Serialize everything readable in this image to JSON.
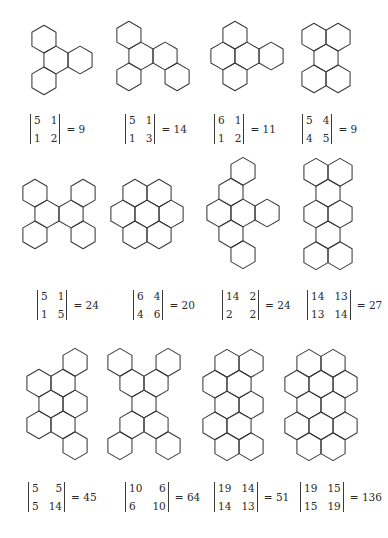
{
  "figure": {
    "stroke_color": "#3a3a3a",
    "background": "#ffffff",
    "hex_side_px": 13.9,
    "items": [
      {
        "id": "s1",
        "center": [
          62,
          60
        ],
        "hexes": [
          [
            0,
            0
          ],
          [
            0,
            1
          ],
          [
            1,
            1
          ],
          [
            -1,
            2
          ]
        ],
        "matrix": [
          [
            "5",
            "1"
          ],
          [
            "1",
            "2"
          ]
        ],
        "value": "9",
        "det_pos": [
          30,
          114
        ]
      },
      {
        "id": "s2",
        "center": [
          153,
          56
        ],
        "hexes": [
          [
            0,
            0
          ],
          [
            0,
            1
          ],
          [
            1,
            1
          ],
          [
            -1,
            2
          ],
          [
            1,
            2
          ]
        ],
        "matrix": [
          [
            "5",
            "1"
          ],
          [
            "1",
            "3"
          ]
        ],
        "value": "14",
        "det_pos": [
          125,
          114
        ]
      },
      {
        "id": "s3",
        "center": [
          247,
          56
        ],
        "hexes": [
          [
            1,
            0
          ],
          [
            0,
            1
          ],
          [
            1,
            1
          ],
          [
            2,
            1
          ],
          [
            0,
            2
          ]
        ],
        "matrix": [
          [
            "6",
            "1"
          ],
          [
            "1",
            "2"
          ]
        ],
        "value": "11",
        "det_pos": [
          214,
          114
        ]
      },
      {
        "id": "s4",
        "center": [
          326,
          58
        ],
        "hexes": [
          [
            0,
            0
          ],
          [
            1,
            0
          ],
          [
            0,
            1
          ],
          [
            -1,
            2
          ],
          [
            0,
            2
          ]
        ],
        "matrix": [
          [
            "5",
            "4"
          ],
          [
            "4",
            "5"
          ]
        ],
        "value": "9",
        "det_pos": [
          302,
          114
        ]
      },
      {
        "id": "s5",
        "center": [
          59,
          214
        ],
        "hexes": [
          [
            0,
            0
          ],
          [
            2,
            0
          ],
          [
            0,
            1
          ],
          [
            1,
            1
          ],
          [
            -1,
            2
          ],
          [
            1,
            2
          ]
        ],
        "matrix": [
          [
            "5",
            "1"
          ],
          [
            "1",
            "5"
          ]
        ],
        "value": "24",
        "det_pos": [
          37,
          290
        ]
      },
      {
        "id": "s6",
        "center": [
          147,
          214
        ],
        "hexes": [
          [
            0,
            0
          ],
          [
            1,
            0
          ],
          [
            -1,
            1
          ],
          [
            0,
            1
          ],
          [
            1,
            1
          ],
          [
            -1,
            2
          ],
          [
            0,
            2
          ]
        ],
        "matrix": [
          [
            "6",
            "4"
          ],
          [
            "4",
            "6"
          ]
        ],
        "value": "20",
        "det_pos": [
          133,
          290
        ]
      },
      {
        "id": "s7",
        "center": [
          243,
          213
        ],
        "hexes": [
          [
            2,
            0
          ],
          [
            1,
            1
          ],
          [
            0,
            2
          ],
          [
            1,
            2
          ],
          [
            2,
            2
          ],
          [
            0,
            3
          ],
          [
            0,
            4
          ]
        ],
        "matrix": [
          [
            "14",
            "2"
          ],
          [
            "2",
            "2"
          ]
        ],
        "value": "24",
        "det_pos": [
          222,
          290
        ]
      },
      {
        "id": "s8",
        "center": [
          328,
          214
        ],
        "hexes": [
          [
            0,
            0
          ],
          [
            1,
            0
          ],
          [
            0,
            1
          ],
          [
            -1,
            2
          ],
          [
            0,
            2
          ],
          [
            -1,
            3
          ],
          [
            -2,
            4
          ],
          [
            -1,
            4
          ]
        ],
        "matrix": [
          [
            "14",
            "13"
          ],
          [
            "13",
            "14"
          ]
        ],
        "value": "27",
        "det_pos": [
          307,
          290
        ]
      },
      {
        "id": "s9",
        "center": [
          57,
          404
        ],
        "hexes": [
          [
            2,
            0
          ],
          [
            0,
            1
          ],
          [
            1,
            1
          ],
          [
            0,
            2
          ],
          [
            1,
            2
          ],
          [
            -1,
            3
          ],
          [
            0,
            3
          ],
          [
            0,
            4
          ]
        ],
        "matrix": [
          [
            "5",
            "5"
          ],
          [
            "5",
            "14"
          ]
        ],
        "value": "45",
        "det_pos": [
          28,
          482
        ]
      },
      {
        "id": "s10",
        "center": [
          144,
          404
        ],
        "hexes": [
          [
            0,
            0
          ],
          [
            2,
            0
          ],
          [
            0,
            1
          ],
          [
            1,
            1
          ],
          [
            0,
            2
          ],
          [
            -1,
            3
          ],
          [
            0,
            3
          ],
          [
            -2,
            4
          ],
          [
            0,
            4
          ]
        ],
        "matrix": [
          [
            "10",
            "6"
          ],
          [
            "6",
            "10"
          ]
        ],
        "value": "64",
        "det_pos": [
          125,
          482
        ]
      },
      {
        "id": "s11",
        "center": [
          233,
          405
        ],
        "hexes": [
          [
            0,
            0
          ],
          [
            1,
            0
          ],
          [
            -1,
            1
          ],
          [
            0,
            1
          ],
          [
            -1,
            2
          ],
          [
            0,
            2
          ],
          [
            -2,
            3
          ],
          [
            -1,
            3
          ],
          [
            -2,
            4
          ],
          [
            -1,
            4
          ]
        ],
        "matrix": [
          [
            "19",
            "14"
          ],
          [
            "14",
            "13"
          ]
        ],
        "value": "51",
        "det_pos": [
          214,
          482
        ]
      },
      {
        "id": "s12",
        "center": [
          321,
          405
        ],
        "hexes": [
          [
            0,
            0
          ],
          [
            1,
            0
          ],
          [
            -1,
            1
          ],
          [
            0,
            1
          ],
          [
            1,
            1
          ],
          [
            -1,
            2
          ],
          [
            0,
            2
          ],
          [
            -2,
            3
          ],
          [
            -1,
            3
          ],
          [
            0,
            3
          ],
          [
            -2,
            4
          ],
          [
            -1,
            4
          ]
        ],
        "matrix": [
          [
            "19",
            "15"
          ],
          [
            "15",
            "19"
          ]
        ],
        "value": "136",
        "det_pos": [
          300,
          482
        ]
      }
    ]
  },
  "labels": {
    "eq": "= "
  }
}
